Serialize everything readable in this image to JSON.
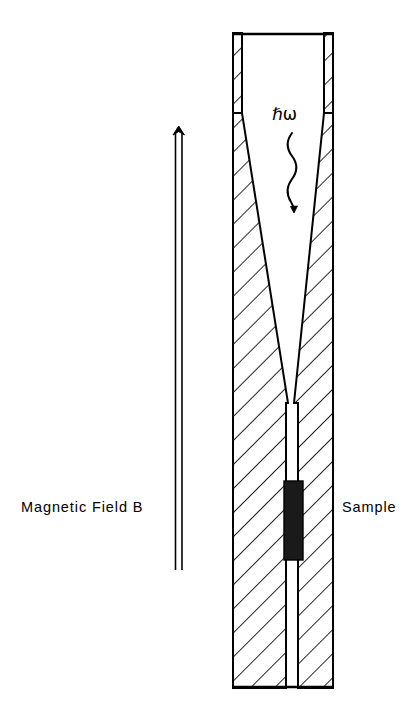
{
  "figure": {
    "background_color": "#ffffff",
    "line_color": "#000000",
    "sample_fill_color": "#1a1a1a",
    "width": 420,
    "height": 711
  },
  "labels": {
    "magnetic_field": "Magnetic Field B",
    "sample": "Sample",
    "photon_energy": "ℏω"
  },
  "annotations": {
    "field_arrow": {
      "name": "magnetic-field-arrow",
      "direction": "up",
      "style": "double-line",
      "x_left": 175,
      "x_right": 182,
      "y_top": 127,
      "y_bottom": 570
    },
    "photon_wave": {
      "name": "photon-wavy-arrow",
      "direction": "down",
      "x": 292,
      "y_top": 133,
      "y_bottom": 212,
      "wavelength": 26,
      "amplitude": 9
    }
  },
  "apparatus": {
    "name": "tapered-light-pipe-cryostat",
    "outer_left": 233,
    "outer_right": 333,
    "top": 33,
    "bottom": 688,
    "neck_top": 33,
    "neck_bottom": 113,
    "neck_wall_thickness": 9,
    "cone_top_y": 113,
    "cone_bottom_y": 403,
    "cone_top_inner_left": 242,
    "cone_top_inner_right": 324,
    "cone_bottom_inner_left": 288,
    "cone_bottom_inner_right": 294,
    "channel_left": 286,
    "channel_right": 298,
    "hatch_angle_degrees": 45,
    "hatch_spacing": 17
  },
  "sample_block": {
    "name": "sample-block",
    "x": 284,
    "y": 481,
    "width": 19,
    "height": 79,
    "fill": "#1a1a1a"
  }
}
